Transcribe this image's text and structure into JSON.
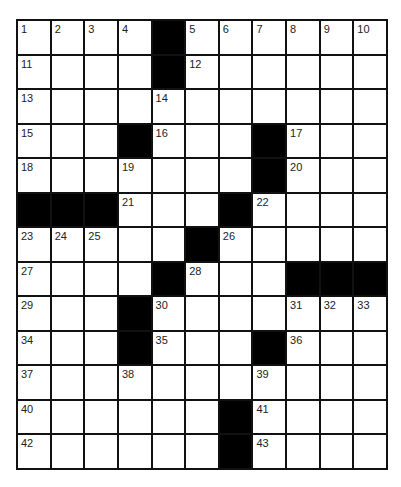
{
  "puzzle": {
    "rows": 13,
    "cols": 11,
    "colors": {
      "block": "#000000",
      "cell": "#ffffff",
      "line": "#111111",
      "number": "#222222"
    },
    "grid": [
      [
        "1",
        "2",
        "3",
        "4",
        "#",
        "5",
        "6",
        "7",
        "8",
        "9",
        "10"
      ],
      [
        "11",
        "",
        "",
        "",
        "#",
        "12",
        "",
        "",
        "",
        "",
        ""
      ],
      [
        "13",
        "",
        "",
        "",
        "14",
        "",
        "",
        "",
        "",
        "",
        ""
      ],
      [
        "15",
        "",
        "",
        "#",
        "16",
        "",
        "",
        "#",
        "17",
        "",
        ""
      ],
      [
        "18",
        "",
        "",
        "19",
        "",
        "",
        "",
        "#",
        "20",
        "",
        ""
      ],
      [
        "#",
        "#",
        "#",
        "21",
        "",
        "",
        "#",
        "22",
        "",
        "",
        ""
      ],
      [
        "23",
        "24",
        "25",
        "",
        "",
        "#",
        "26",
        "",
        "",
        "",
        ""
      ],
      [
        "27",
        "",
        "",
        "",
        "#",
        "28",
        "",
        "",
        "#",
        "#",
        "#"
      ],
      [
        "29",
        "",
        "",
        "#",
        "30",
        "",
        "",
        "",
        "31",
        "32",
        "33"
      ],
      [
        "34",
        "",
        "",
        "#",
        "35",
        "",
        "",
        "#",
        "36",
        "",
        ""
      ],
      [
        "37",
        "",
        "",
        "38",
        "",
        "",
        "",
        "39",
        "",
        "",
        ""
      ],
      [
        "40",
        "",
        "",
        "",
        "",
        "",
        "#",
        "41",
        "",
        "",
        ""
      ],
      [
        "42",
        "",
        "",
        "",
        "",
        "",
        "#",
        "43",
        "",
        "",
        ""
      ]
    ]
  }
}
